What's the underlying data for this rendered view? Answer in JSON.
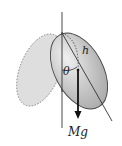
{
  "diagram": {
    "type": "physics-free-body",
    "labels": {
      "length": "h",
      "angle": "θ",
      "force": "Mg"
    },
    "elements": [
      "vertical-reference-line",
      "tilted-disc",
      "dashed-previous-disc-position",
      "symmetry-axis",
      "center-to-pivot-dashed-line",
      "angle-arc",
      "gravity-arrow"
    ],
    "colors": {
      "disc_fill": "#bdbdbd",
      "dashed_fill": "#dcdcdc",
      "line": "#333333",
      "background": "#ffffff"
    }
  }
}
